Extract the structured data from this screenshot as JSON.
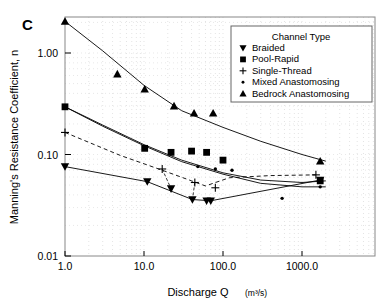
{
  "panel": {
    "label": "C"
  },
  "axes": {
    "x": {
      "title": "Discharge Q",
      "units": "(m³/s)",
      "ticks": [
        "1.0",
        "10.0",
        "100.0",
        "1000.0"
      ],
      "tick_values": [
        1,
        10,
        100,
        1000
      ],
      "range": [
        1,
        4000
      ]
    },
    "y": {
      "title": "Manning's Resistance Coefficient, n",
      "ticks": [
        "1.00",
        "0.10",
        "0.01"
      ],
      "tick_values": [
        1.0,
        0.1,
        0.01
      ],
      "range": [
        0.01,
        2.4
      ]
    }
  },
  "legend": {
    "title": "Channel Type",
    "items": [
      {
        "label": "Braided",
        "marker": "down-triangle"
      },
      {
        "label": "Pool-Rapid",
        "marker": "square"
      },
      {
        "label": "Single-Thread",
        "marker": "plus"
      },
      {
        "label": "Mixed Anastomosing",
        "marker": "dot"
      },
      {
        "label": "Bedrock Anastomosing",
        "marker": "up-triangle"
      }
    ]
  },
  "chart_data": {
    "type": "scatter",
    "title": "",
    "subtitle": "",
    "xlabel": "Discharge Q (m³/s)",
    "ylabel": "Manning's Resistance Coefficient, n",
    "xscale": "log",
    "yscale": "log",
    "xlim": [
      1,
      4000
    ],
    "ylim": [
      0.01,
      2.4
    ],
    "grid": "minor-dotted",
    "legend_position": "top-right",
    "series": [
      {
        "name": "Bedrock Anastomosing",
        "marker": "up-triangle",
        "line": "solid",
        "points": [
          [
            1.0,
            2.05
          ],
          [
            4.6,
            0.62
          ],
          [
            10.2,
            0.44
          ],
          [
            24.0,
            0.3
          ],
          [
            43.0,
            0.255
          ],
          [
            75.0,
            0.255
          ],
          [
            1700.0,
            0.086
          ]
        ],
        "fit": [
          [
            1.0,
            2.05
          ],
          [
            3.0,
            1.05
          ],
          [
            10.0,
            0.48
          ],
          [
            30.0,
            0.27
          ],
          [
            100.0,
            0.185
          ],
          [
            300.0,
            0.135
          ],
          [
            1000.0,
            0.1
          ],
          [
            2000.0,
            0.086
          ]
        ]
      },
      {
        "name": "Pool-Rapid",
        "marker": "square",
        "line": "solid",
        "points": [
          [
            1.0,
            0.295
          ],
          [
            10.2,
            0.115
          ],
          [
            22.0,
            0.105
          ],
          [
            40.0,
            0.108
          ],
          [
            62.0,
            0.105
          ],
          [
            100.0,
            0.088
          ],
          [
            1700.0,
            0.055
          ]
        ],
        "fit": [
          [
            1.0,
            0.295
          ],
          [
            3.0,
            0.195
          ],
          [
            10.0,
            0.125
          ],
          [
            30.0,
            0.088
          ],
          [
            100.0,
            0.066
          ],
          [
            300.0,
            0.056
          ],
          [
            1000.0,
            0.053
          ],
          [
            2000.0,
            0.055
          ]
        ]
      },
      {
        "name": "Mixed Anastomosing",
        "marker": "dot",
        "line": "solid",
        "points": [
          [
            1.0,
            0.295
          ],
          [
            48.0,
            0.076
          ],
          [
            80.0,
            0.072
          ],
          [
            130.0,
            0.07
          ],
          [
            560.0,
            0.037
          ],
          [
            1700.0,
            0.048
          ]
        ],
        "fit": [
          [
            1.0,
            0.295
          ],
          [
            3.0,
            0.19
          ],
          [
            10.0,
            0.122
          ],
          [
            30.0,
            0.085
          ],
          [
            100.0,
            0.064
          ],
          [
            300.0,
            0.052
          ],
          [
            1000.0,
            0.048
          ],
          [
            2000.0,
            0.048
          ]
        ]
      },
      {
        "name": "Single-Thread",
        "marker": "plus",
        "line": "dashed",
        "points": [
          [
            1.0,
            0.165
          ],
          [
            17.0,
            0.072
          ],
          [
            44.0,
            0.053
          ],
          [
            80.0,
            0.047
          ],
          [
            1500.0,
            0.063
          ]
        ],
        "fit": [
          [
            1.0,
            0.165
          ],
          [
            5.0,
            0.098
          ],
          [
            17.0,
            0.07
          ],
          [
            40.0,
            0.055
          ],
          [
            60.0,
            0.049
          ],
          [
            120.0,
            0.059
          ],
          [
            400.0,
            0.062
          ],
          [
            1500.0,
            0.063
          ]
        ]
      },
      {
        "name": "Braided",
        "marker": "down-triangle",
        "line": "solid",
        "points": [
          [
            1.0,
            0.076
          ],
          [
            11.0,
            0.054
          ],
          [
            22.0,
            0.046
          ],
          [
            41.0,
            0.036
          ],
          [
            62.0,
            0.035
          ],
          [
            70.0,
            0.035
          ],
          [
            1700.0,
            0.056
          ]
        ],
        "fit": [
          [
            1.0,
            0.076
          ],
          [
            11.0,
            0.054
          ],
          [
            41.0,
            0.036
          ],
          [
            70.0,
            0.035
          ],
          [
            1700.0,
            0.056
          ]
        ]
      }
    ]
  }
}
